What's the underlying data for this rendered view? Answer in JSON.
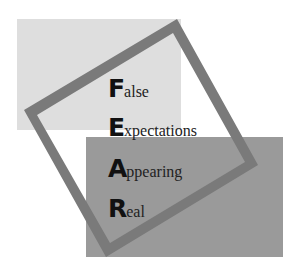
{
  "acronym": {
    "title": "FEAR",
    "words": [
      {
        "initial": "F",
        "rest": "alse"
      },
      {
        "initial": "E",
        "rest": "xpectations"
      },
      {
        "initial": "A",
        "rest": "ppearing"
      },
      {
        "initial": "R",
        "rest": "eal"
      }
    ]
  },
  "colors": {
    "light_rect": "#dedede",
    "dark_rect": "#9a9a9a",
    "frame": "#7a7a7a",
    "text": "#111111"
  }
}
